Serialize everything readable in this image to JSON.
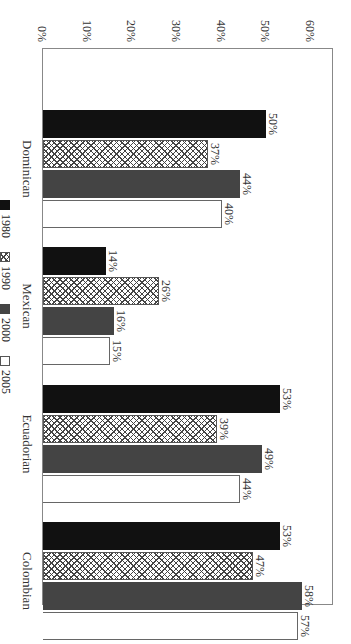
{
  "chart_data": {
    "type": "bar",
    "orientation": "vertical bars, image rotated 90 degrees clockwise",
    "title": "",
    "xlabel": "",
    "ylabel": "",
    "categories": [
      "Dominican",
      "Mexican",
      "Ecuadorian",
      "Colombian"
    ],
    "series": [
      {
        "name": "1980",
        "fill": "solid black",
        "color": "#111111",
        "values": [
          50,
          14,
          53,
          53
        ]
      },
      {
        "name": "1990",
        "fill": "cross-hatch",
        "color": "#999999",
        "values": [
          37,
          26,
          39,
          47
        ]
      },
      {
        "name": "2000",
        "fill": "solid dark gray",
        "color": "#444444",
        "values": [
          44,
          16,
          49,
          58
        ]
      },
      {
        "name": "2005",
        "fill": "white outline",
        "color": "#ffffff",
        "values": [
          40,
          15,
          44,
          57
        ]
      }
    ],
    "value_labels": {
      "Dominican": [
        "50%",
        "37%",
        "44%",
        "40%"
      ],
      "Mexican": [
        "14%",
        "26%",
        "16%",
        "15%"
      ],
      "Ecuadorian": [
        "53%",
        "39%",
        "49%",
        "44%"
      ],
      "Colombian": [
        "53%",
        "47%",
        "58%",
        "57%"
      ]
    },
    "yticks": [
      "0%",
      "10%",
      "20%",
      "30%",
      "40%",
      "50%",
      "60%"
    ],
    "ylim": [
      0,
      60
    ],
    "grid": false,
    "legend_position": "bottom"
  },
  "axis": {
    "ticks": [
      "0%",
      "10%",
      "20%",
      "30%",
      "40%",
      "50%",
      "60%"
    ]
  },
  "legend": [
    {
      "label": "1980"
    },
    {
      "label": "1990"
    },
    {
      "label": "2000"
    },
    {
      "label": "2005"
    }
  ],
  "groups": [
    {
      "name": "Dominican",
      "labels": [
        "50%",
        "37%",
        "44%",
        "40%"
      ]
    },
    {
      "name": "Mexican",
      "labels": [
        "14%",
        "26%",
        "16%",
        "15%"
      ]
    },
    {
      "name": "Ecuadorian",
      "labels": [
        "53%",
        "39%",
        "49%",
        "44%"
      ]
    },
    {
      "name": "Colombian",
      "labels": [
        "53%",
        "47%",
        "58%",
        "57%"
      ]
    }
  ]
}
